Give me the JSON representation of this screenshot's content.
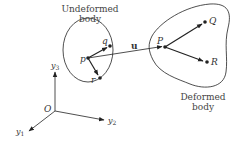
{
  "figure": {
    "undeformed_label_line1": "Undeformed",
    "undeformed_label_line2": "body",
    "deformed_label_line1": "Deformed",
    "deformed_label_line2": "body",
    "displacement_label": "u",
    "axes": {
      "origin": "O",
      "y1": "y",
      "y1_sub": "1",
      "y2": "y",
      "y2_sub": "2",
      "y3": "y",
      "y3_sub": "3"
    },
    "undeformed_points": {
      "p": "p",
      "q": "q",
      "r": "r"
    },
    "deformed_points": {
      "P": "P",
      "Q": "Q",
      "R": "R"
    }
  },
  "colors": {
    "stroke": "#222222",
    "text": "#333333",
    "background": "#ffffff"
  }
}
